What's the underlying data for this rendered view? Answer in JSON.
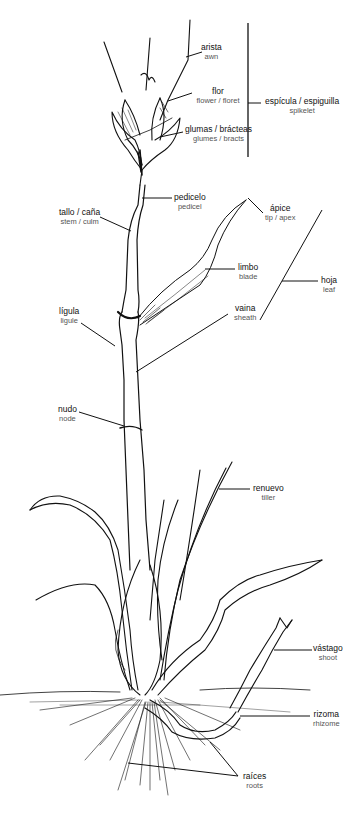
{
  "diagram": {
    "type": "botanical-anatomy",
    "labels": [
      {
        "id": "arista",
        "es": "arista",
        "en": "awn",
        "x": 201,
        "y": 42
      },
      {
        "id": "flor",
        "es": "flor",
        "en": "flower / floret",
        "x": 184,
        "y": 88
      },
      {
        "id": "glumas",
        "es": "glumas / brácteas",
        "en": "glumes / bracts",
        "x": 187,
        "y": 125
      },
      {
        "id": "espicula",
        "es": "espícula / espiguilla",
        "en": "spikelet",
        "x": 283,
        "y": 96
      },
      {
        "id": "pedicelo",
        "es": "pedicelo",
        "en": "pedicel",
        "x": 184,
        "y": 190
      },
      {
        "id": "apice",
        "es": "ápice",
        "en": "tip / apex",
        "x": 282,
        "y": 205
      },
      {
        "id": "tallo",
        "es": "tallo / caña",
        "en": "stem / culm",
        "x": 76,
        "y": 208
      },
      {
        "id": "limbo",
        "es": "limbo",
        "en": "blade",
        "x": 248,
        "y": 263
      },
      {
        "id": "hoja",
        "es": "hoja",
        "en": "leaf",
        "x": 327,
        "y": 277
      },
      {
        "id": "vaina",
        "es": "vaina",
        "en": "sheath",
        "x": 246,
        "y": 304
      },
      {
        "id": "ligula",
        "es": "lígula",
        "en": "ligule",
        "x": 69,
        "y": 307
      },
      {
        "id": "nudo",
        "es": "nudo",
        "en": "node",
        "x": 67,
        "y": 408
      },
      {
        "id": "renuevo",
        "es": "renuevo",
        "en": "tiller",
        "x": 267,
        "y": 484
      },
      {
        "id": "vastago",
        "es": "vástago",
        "en": "shoot",
        "x": 325,
        "y": 645
      },
      {
        "id": "rizoma",
        "es": "rizoma",
        "en": "rhizome",
        "x": 323,
        "y": 711
      },
      {
        "id": "raices",
        "es": "raíces",
        "en": "roots",
        "x": 250,
        "y": 773
      }
    ]
  }
}
